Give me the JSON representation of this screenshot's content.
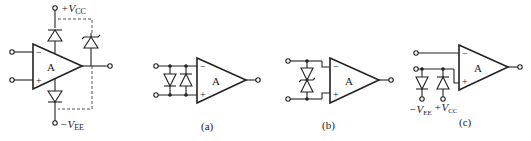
{
  "main_circuit": {
    "amp_label": "A",
    "inv_sign": "−",
    "noninv_sign": "+",
    "vcc_label": "+V",
    "vcc_sub": "CC",
    "vee_label": "−V",
    "vee_sub": "EE"
  },
  "circuit_a": {
    "amp_label": "A",
    "inv_sign": "−",
    "noninv_sign": "+",
    "caption": "(a)"
  },
  "circuit_b": {
    "amp_label": "A",
    "inv_sign": "−",
    "noninv_sign": "+",
    "caption": "(b)"
  },
  "circuit_c": {
    "amp_label": "A",
    "inv_sign": "−",
    "noninv_sign": "+",
    "vee_label": "−V",
    "vee_sub": "EE",
    "vcc_label": "+V",
    "vcc_sub": "CC",
    "caption": "(c)"
  }
}
